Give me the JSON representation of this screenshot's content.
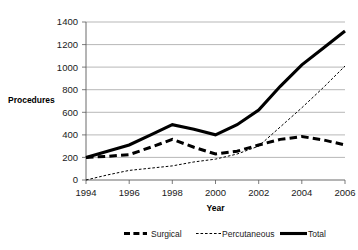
{
  "chart_data": {
    "type": "line",
    "title": "",
    "xlabel": "Year",
    "ylabel": "Procedures",
    "x": [
      1994,
      1995,
      1996,
      1997,
      1998,
      1999,
      2000,
      2001,
      2002,
      2003,
      2004,
      2005,
      2006
    ],
    "xtick_labels": [
      "1994",
      "1996",
      "1998",
      "2000",
      "2002",
      "2004",
      "2006"
    ],
    "xtick_values": [
      1994,
      1996,
      1998,
      2000,
      2002,
      2004,
      2006
    ],
    "ytick_labels": [
      "0",
      "200",
      "400",
      "600",
      "800",
      "1000",
      "1200",
      "1400"
    ],
    "ytick_values": [
      0,
      200,
      400,
      600,
      800,
      1000,
      1200,
      1400
    ],
    "xlim": [
      1994,
      2006
    ],
    "ylim": [
      0,
      1400
    ],
    "grid": "horizontal",
    "legend_position": "bottom",
    "series": [
      {
        "name": "Surgical",
        "style": "thick-dashed",
        "color": "#000000",
        "values": [
          200,
          210,
          225,
          290,
          360,
          290,
          230,
          255,
          310,
          360,
          385,
          355,
          310
        ]
      },
      {
        "name": "Percutaneous",
        "style": "thin-dotted",
        "color": "#000000",
        "values": [
          0,
          45,
          85,
          105,
          125,
          160,
          185,
          230,
          300,
          470,
          640,
          820,
          1010
        ]
      },
      {
        "name": "Total",
        "style": "thick-solid",
        "color": "#000000",
        "values": [
          200,
          255,
          310,
          400,
          490,
          450,
          400,
          490,
          620,
          830,
          1020,
          1170,
          1320
        ]
      }
    ]
  },
  "legend": {
    "items": [
      {
        "label": "Surgical"
      },
      {
        "label": "Percutaneous"
      },
      {
        "label": "Total"
      }
    ]
  },
  "axes": {
    "y_axis_title": "Procedures",
    "x_axis_title": "Year"
  }
}
